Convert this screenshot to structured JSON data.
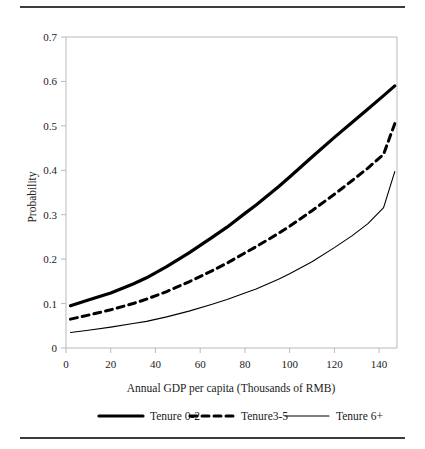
{
  "figure": {
    "top_rule": "horizontal-rule",
    "bottom_rule": "horizontal-rule"
  },
  "chart_data": {
    "type": "line",
    "title": "",
    "xlabel": "Annual GDP per capita (Thousands of RMB)",
    "ylabel": "Probability",
    "xlim": [
      0,
      148
    ],
    "ylim": [
      0,
      0.7
    ],
    "xticks": [
      0,
      20,
      40,
      60,
      80,
      100,
      120,
      140
    ],
    "xtick_labels": [
      "0",
      "20",
      "40",
      "60",
      "80",
      "100",
      "120",
      "140"
    ],
    "yticks": [
      0,
      0.1,
      0.2,
      0.3,
      0.4,
      0.5,
      0.6,
      0.7
    ],
    "ytick_labels": [
      "0",
      "0.1",
      "0.2",
      "0.3",
      "0.4",
      "0.5",
      "0.6",
      "0.7"
    ],
    "grid": false,
    "legend_position": "below-axis",
    "x": [
      2,
      10,
      20,
      30,
      36,
      45,
      55,
      65,
      72,
      80,
      85,
      95,
      100,
      110,
      120,
      128,
      135,
      142,
      147
    ],
    "series": [
      {
        "name": "Tenure 0-2",
        "style": "solid-thick",
        "color": "#000000",
        "linewidth": 3.2,
        "values": [
          0.095,
          0.108,
          0.124,
          0.144,
          0.158,
          0.183,
          0.214,
          0.248,
          0.272,
          0.303,
          0.322,
          0.363,
          0.385,
          0.43,
          0.474,
          0.508,
          0.538,
          0.568,
          0.59
        ]
      },
      {
        "name": "Tenure3-5",
        "style": "dashed",
        "color": "#000000",
        "linewidth": 3.0,
        "dash": "7,5",
        "values": [
          0.065,
          0.074,
          0.086,
          0.1,
          0.11,
          0.127,
          0.149,
          0.173,
          0.191,
          0.214,
          0.228,
          0.258,
          0.274,
          0.309,
          0.346,
          0.377,
          0.405,
          0.436,
          0.505
        ]
      },
      {
        "name": "Tenure 6+",
        "style": "solid-thin",
        "color": "#000000",
        "linewidth": 1.1,
        "values": [
          0.035,
          0.04,
          0.047,
          0.055,
          0.06,
          0.07,
          0.083,
          0.098,
          0.109,
          0.124,
          0.133,
          0.155,
          0.167,
          0.194,
          0.226,
          0.253,
          0.28,
          0.316,
          0.397
        ]
      }
    ]
  },
  "legend": {
    "items": [
      {
        "label": "Tenure 0-2"
      },
      {
        "label": "Tenure3-5"
      },
      {
        "label": "Tenure 6+"
      }
    ]
  }
}
